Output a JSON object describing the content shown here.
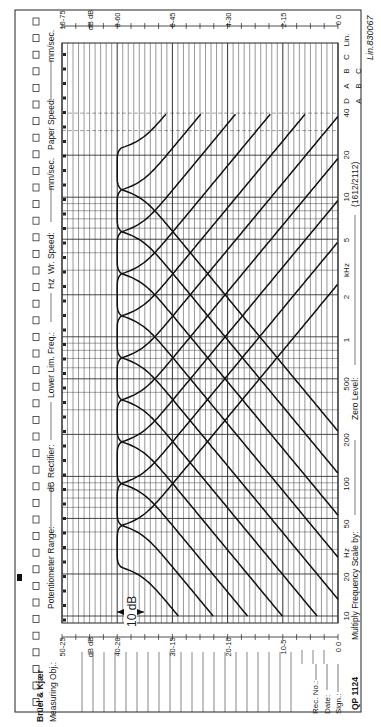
{
  "header": {
    "brand": "Brüel & Kjær",
    "measuring_obj_label": "Measuring Obj.:",
    "potentiometer_label": "Potentiometer Range:",
    "potentiometer_unit": "dB",
    "rectifier_label": "Rectifier:",
    "lower_lim_label": "Lower Lim. Freq.:",
    "lower_lim_unit": "Hz",
    "wr_speed_label": "Wr. Speed:",
    "wr_speed_unit": "mm/sec.",
    "paper_speed_label": "Paper Speed:",
    "paper_speed_unit": "mm/sec."
  },
  "footer": {
    "multiply_label": "Multiply Frequency Scale by:",
    "zero_level_label": "Zero Level:",
    "paper_code": "(1612/2112)",
    "form_id": "QP 1124",
    "rec_no_label": "Rec. No.:",
    "date_label": "Date:",
    "sign_label": "Sign.:",
    "serial": "830067"
  },
  "annotation": {
    "scale_bar_label": "10 dB"
  },
  "weighting": {
    "row1": [
      "D",
      "A",
      "B",
      "C",
      "Lin."
    ],
    "row2": [
      "A",
      "B",
      "C",
      "Lin."
    ]
  },
  "chart_data": {
    "type": "line",
    "orientation": "rotated 90° counter-clockwise (frequency axis vertical, level axis horizontal)",
    "xlabel": "Frequency (Hz)",
    "ylabel": "Level (dB)",
    "x_scale": "log",
    "xlim": [
      10,
      40000
    ],
    "ylim": [
      0,
      50
    ],
    "grid": true,
    "x_tick_labels": [
      "10",
      "20",
      "Hz",
      "50",
      "100",
      "200",
      "500",
      "1",
      "2",
      "kHz",
      "5",
      "10",
      "20",
      "40"
    ],
    "x_ticks_hz": [
      10,
      20,
      50,
      100,
      200,
      500,
      1000,
      2000,
      5000,
      10000,
      20000,
      40000
    ],
    "y_scales": {
      "top_scale": [
        "10-75",
        "dB dB",
        "8-60",
        "6-45",
        "4-30",
        "2-15",
        "0 0"
      ],
      "bottom_scale": [
        "50-25",
        "dB dB",
        "40-20",
        "30-15",
        "20-10",
        "10-5",
        "0 0"
      ]
    },
    "y_ticks_db": [
      0,
      10,
      20,
      30,
      40,
      50
    ],
    "scale_annotation": "10 dB",
    "series": [
      {
        "name": "31.5 Hz octave",
        "center_hz": 31.5,
        "peak_db": 40
      },
      {
        "name": "63 Hz octave",
        "center_hz": 63,
        "peak_db": 40
      },
      {
        "name": "125 Hz octave",
        "center_hz": 125,
        "peak_db": 40
      },
      {
        "name": "250 Hz octave",
        "center_hz": 250,
        "peak_db": 40
      },
      {
        "name": "500 Hz octave",
        "center_hz": 500,
        "peak_db": 40
      },
      {
        "name": "1 kHz octave",
        "center_hz": 1000,
        "peak_db": 40
      },
      {
        "name": "2 kHz octave",
        "center_hz": 2000,
        "peak_db": 40
      },
      {
        "name": "4 kHz octave",
        "center_hz": 4000,
        "peak_db": 40
      },
      {
        "name": "8 kHz octave",
        "center_hz": 8000,
        "peak_db": 40
      },
      {
        "name": "16 kHz octave",
        "center_hz": 16000,
        "peak_db": 40
      }
    ],
    "filter_shape": {
      "passband_halfwidth_octaves": 0.5,
      "skirt_slope_db_per_octave": 6.3
    }
  }
}
